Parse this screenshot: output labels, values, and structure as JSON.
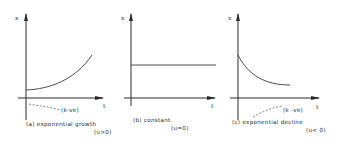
{
  "figure": {
    "panels": [
      {
        "id": "a",
        "y_axis_label": "x",
        "x_axis_label": "t",
        "curve_type": "exponential growth curve",
        "dashed_annotation": "(k-ve)",
        "caption": "(a) exponential growth",
        "condition": "(u>0)"
      },
      {
        "id": "b",
        "y_axis_label": "x",
        "x_axis_label": "t",
        "curve_type": "constant horizontal line",
        "caption": "(b) constant",
        "condition": "(u=0)"
      },
      {
        "id": "c",
        "y_axis_label": "x",
        "x_axis_label": "t",
        "curve_type": "exponential decay curve",
        "dashed_annotation": "(k -ve)",
        "caption": "(c) exponential decline",
        "condition": "(u< 0)"
      }
    ],
    "colors": {
      "background": "#ffffff",
      "ink": "#2b2b2b"
    }
  }
}
